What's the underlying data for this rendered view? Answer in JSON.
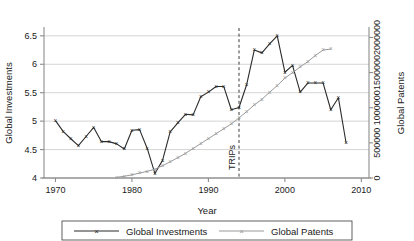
{
  "chart_data": {
    "type": "line",
    "title": "",
    "xlabel": "Year",
    "ylabel": "Global Investments",
    "y2label": "Global Patents",
    "xlim": [
      1968.5,
      2011.0
    ],
    "ylim": [
      4,
      6.62
    ],
    "y2lim": [
      0,
      2120000
    ],
    "grid": true,
    "grid_axis": "y",
    "legend_position": "bottom",
    "xticks": [
      "1970",
      "1980",
      "1990",
      "2000",
      "2010"
    ],
    "xtick_values": [
      1970,
      1980,
      1990,
      2000,
      2010
    ],
    "yticks": [
      "4",
      "4.5",
      "5",
      "5.5",
      "6",
      "6.5"
    ],
    "ytick_values": [
      4,
      4.5,
      5,
      5.5,
      6,
      6.5
    ],
    "y2ticks": [
      "0",
      "500000",
      "1000000",
      "1500000",
      "2000000"
    ],
    "y2tick_values": [
      0,
      500000,
      1000000,
      1500000,
      2000000
    ],
    "annotations": [
      {
        "label": "TRIPs",
        "x": 1994,
        "style": "dashed-vline",
        "orientation": "vertical"
      }
    ],
    "series": [
      {
        "name": "Global Investments",
        "axis": "left",
        "color": "#2b2b2b",
        "marker": "x",
        "x": [
          1970,
          1971,
          1972,
          1973,
          1974,
          1975,
          1976,
          1977,
          1978,
          1979,
          1980,
          1981,
          1982,
          1983,
          1984,
          1985,
          1986,
          1987,
          1988,
          1989,
          1990,
          1991,
          1992,
          1993,
          1994,
          1995,
          1996,
          1997,
          1998,
          1999,
          2000,
          2001,
          2002,
          2003,
          2004,
          2005,
          2006,
          2007,
          2008
        ],
        "values": [
          5.01,
          4.82,
          4.69,
          4.57,
          4.73,
          4.89,
          4.64,
          4.64,
          4.6,
          4.51,
          4.84,
          4.85,
          4.52,
          4.08,
          4.31,
          4.81,
          4.97,
          5.12,
          5.11,
          5.43,
          5.51,
          5.61,
          5.61,
          5.2,
          5.24,
          5.64,
          6.25,
          6.2,
          6.36,
          6.5,
          5.86,
          5.98,
          5.51,
          5.67,
          5.67,
          5.67,
          5.2,
          5.41,
          4.62
        ]
      },
      {
        "name": "Global Patents",
        "axis": "right",
        "color": "#9a9a9a",
        "marker": "x",
        "x": [
          1978,
          1979,
          1980,
          1981,
          1982,
          1983,
          1984,
          1985,
          1986,
          1987,
          1988,
          1989,
          1990,
          1991,
          1992,
          1993,
          1994,
          1995,
          1996,
          1997,
          1998,
          1999,
          2000,
          2001,
          2002,
          2003,
          2004,
          2005,
          2006
        ],
        "values": [
          10000,
          25000,
          45000,
          70000,
          95000,
          125000,
          175000,
          230000,
          290000,
          350000,
          420000,
          490000,
          560000,
          630000,
          700000,
          770000,
          855000,
          945000,
          1040000,
          1120000,
          1220000,
          1315000,
          1420000,
          1500000,
          1580000,
          1655000,
          1745000,
          1820000,
          1835000
        ]
      }
    ]
  },
  "legend": {
    "items": [
      {
        "label": "Global Investments",
        "color": "#2b2b2b"
      },
      {
        "label": "Global Patents",
        "color": "#9a9a9a"
      }
    ]
  }
}
